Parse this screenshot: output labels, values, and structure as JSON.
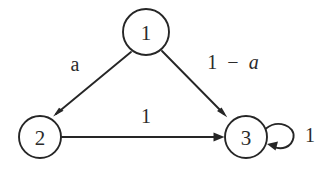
{
  "diagram": {
    "type": "state-transition-diagram",
    "title": "",
    "background_color": "#ffffff",
    "stroke_color": "#262626",
    "text_color": "#2b2b2b",
    "nodes": [
      {
        "id": "1",
        "label": "1",
        "cx": 146,
        "cy": 32,
        "r": 23
      },
      {
        "id": "2",
        "label": "2",
        "cx": 40,
        "cy": 137,
        "r": 21
      },
      {
        "id": "3",
        "label": "3",
        "cx": 246,
        "cy": 137,
        "r": 21
      }
    ],
    "edges": [
      {
        "id": "e1-2",
        "from": "1",
        "to": "2",
        "label": "a",
        "label_italic": true,
        "label_x": 75,
        "label_y": 64
      },
      {
        "id": "e1-3",
        "from": "1",
        "to": "3",
        "label": "1 − a",
        "label_italic": true,
        "label_x": 233,
        "label_y": 62
      },
      {
        "id": "e2-3",
        "from": "2",
        "to": "3",
        "label": "1",
        "label_italic": false,
        "label_x": 146,
        "label_y": 116
      },
      {
        "id": "e3-3",
        "from": "3",
        "to": "3",
        "label": "1",
        "label_italic": false,
        "label_x": 310,
        "label_y": 135,
        "self_loop": true
      }
    ],
    "label_parts": {
      "one_minus_a_num": "1",
      "one_minus_a_minus": "−",
      "one_minus_a_var": "a"
    }
  }
}
